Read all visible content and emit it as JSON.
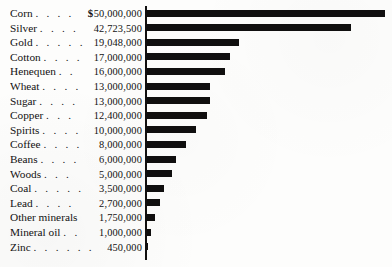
{
  "chart_data": {
    "type": "bar",
    "orientation": "horizontal",
    "title": "",
    "subtitle": "",
    "xlabel": "",
    "ylabel": "",
    "grid": false,
    "legend": false,
    "currency_symbol": "$",
    "currency_symbol_on_first_row_only": true,
    "axis_position": "left",
    "xlim": [
      0,
      50000000
    ],
    "value_unit": "dollars",
    "categories": [
      "Corn",
      "Silver",
      "Gold",
      "Cotton",
      "Henequen",
      "Wheat",
      "Sugar",
      "Copper",
      "Spirits",
      "Coffee",
      "Beans",
      "Woods",
      "Coal",
      "Lead",
      "Other minerals",
      "Mineral oil",
      "Zinc"
    ],
    "values": [
      50000000,
      42723500,
      19048000,
      17000000,
      16000000,
      13000000,
      13000000,
      12400000,
      10000000,
      8000000,
      6000000,
      5000000,
      3500000,
      2700000,
      1750000,
      1000000,
      450000
    ],
    "value_labels": [
      "50,000,000",
      "42,723,500",
      "19,048,000",
      "17,000,000",
      "16,000,000",
      "13,000,000",
      "13,000,000",
      "12,400,000",
      "10,000,000",
      "8,000,000",
      "6,000,000",
      "5,000,000",
      "3,500,000",
      "2,700,000",
      "1,750,000",
      "1,000,000",
      "450,000"
    ],
    "colors": {
      "bar": "#100f0f",
      "axis": "#111010",
      "text": "#131212",
      "background": "#fdfdfc"
    }
  },
  "rows": [
    {
      "label": "Corn",
      "leader": ". . . .",
      "value": "50,000,000",
      "currency": "$",
      "bar_px": 239
    },
    {
      "label": "Silver",
      "leader": ". . . .",
      "value": "42,723,500",
      "currency": "",
      "bar_px": 205
    },
    {
      "label": "Gold",
      "leader": ". . . . .",
      "value": "19,048,000",
      "currency": "",
      "bar_px": 93
    },
    {
      "label": "Cotton",
      "leader": ". . . .",
      "value": "17,000,000",
      "currency": "",
      "bar_px": 84
    },
    {
      "label": "Henequen",
      "leader": ". .",
      "value": "16,000,000",
      "currency": "",
      "bar_px": 79
    },
    {
      "label": "Wheat",
      "leader": ". . . .",
      "value": "13,000,000",
      "currency": "",
      "bar_px": 64
    },
    {
      "label": "Sugar",
      "leader": ". . . .",
      "value": "13,000,000",
      "currency": "",
      "bar_px": 64
    },
    {
      "label": "Copper",
      "leader": ". . .",
      "value": "12,400,000",
      "currency": "",
      "bar_px": 61
    },
    {
      "label": "Spirits",
      "leader": ". . . .",
      "value": "10,000,000",
      "currency": "",
      "bar_px": 50
    },
    {
      "label": "Coffee",
      "leader": ". . . .",
      "value": "8,000,000",
      "currency": "",
      "bar_px": 40
    },
    {
      "label": "Beans",
      "leader": ". . . .",
      "value": "6,000,000",
      "currency": "",
      "bar_px": 30
    },
    {
      "label": "Woods",
      "leader": ". . .",
      "value": "5,000,000",
      "currency": "",
      "bar_px": 26
    },
    {
      "label": "Coal",
      "leader": ". . . . .",
      "value": "3,500,000",
      "currency": "",
      "bar_px": 18
    },
    {
      "label": "Lead",
      "leader": ". . . .",
      "value": "2,700,000",
      "currency": "",
      "bar_px": 14
    },
    {
      "label": "Other minerals",
      "leader": "",
      "value": "1,750,000",
      "currency": "",
      "bar_px": 9
    },
    {
      "label": "Mineral oil",
      "leader": ". .",
      "value": "1,000,000",
      "currency": "",
      "bar_px": 5
    },
    {
      "label": "Zinc",
      "leader": ". . . . . .",
      "value": "450,000",
      "currency": "",
      "bar_px": 2
    }
  ],
  "layout": {
    "row_pitch_px": 14.6,
    "first_row_top_px": 6,
    "axis_left_px": 145,
    "bar_origin_px": 146
  }
}
